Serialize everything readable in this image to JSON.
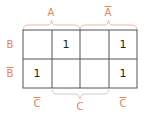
{
  "kmap": {
    "top_labels": [
      {
        "text": "A",
        "negated": false
      },
      {
        "text": "A",
        "negated": true
      }
    ],
    "row_labels": [
      {
        "text": "B",
        "negated": false
      },
      {
        "text": "B",
        "negated": true
      }
    ],
    "bottom_labels": [
      {
        "text": "C",
        "negated": true
      },
      {
        "text": "C",
        "negated": false
      },
      {
        "text": "C",
        "negated": true
      }
    ],
    "cells": [
      [
        "",
        "1",
        "",
        "1"
      ],
      [
        "1",
        "",
        "",
        "1"
      ]
    ],
    "colors": {
      "label": "#e8825a",
      "brace": "#f0b8a0",
      "grid": "#555555",
      "bottom_brace": "#cccccc"
    }
  }
}
